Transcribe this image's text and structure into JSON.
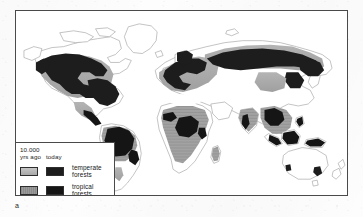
{
  "figure": {
    "panel_label": "a",
    "type": "world-map"
  },
  "legend": {
    "header_line1": "10.000",
    "header_col_old": "yrs ago",
    "header_col_new": "today",
    "rows": [
      {
        "label_line1": "temperate",
        "label_line2": "forests",
        "swatch_old_color": "#b3b3b3",
        "swatch_new_color": "#1d1d1d"
      },
      {
        "label_line1": "tropical",
        "label_line2": "forests",
        "swatch_old_color": "#9a9a9a",
        "swatch_new_color": "#151515"
      }
    ]
  },
  "map": {
    "frame_color": "#4a4a4a",
    "ocean_color": "#ffffff",
    "coastline_color": "#9b9b9b",
    "historic_forest_color": "#a8a8a8",
    "present_forest_color": "#1d1d1d",
    "regions": [
      "North America",
      "Greenland",
      "South America",
      "Europe",
      "Africa",
      "Asia",
      "Siberia",
      "Southeast Asia",
      "Australia",
      "New Zealand",
      "Japan",
      "Madagascar",
      "British Isles",
      "Borneo",
      "New Guinea"
    ]
  }
}
